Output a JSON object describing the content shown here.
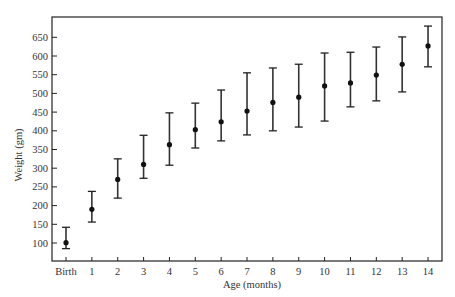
{
  "chart_data": {
    "type": "scatter",
    "subtype": "errorbar",
    "title": "",
    "xlabel": "Age (months)",
    "ylabel": "Weight (gm)",
    "categories": [
      "Birth",
      "1",
      "2",
      "3",
      "4",
      "5",
      "6",
      "7",
      "8",
      "9",
      "10",
      "11",
      "12",
      "13",
      "14"
    ],
    "series": [
      {
        "name": "Mean weight",
        "values": [
          101,
          190,
          270,
          310,
          363,
          403,
          424,
          453,
          476,
          490,
          520,
          528,
          549,
          578,
          627
        ],
        "upper": [
          142,
          238,
          325,
          388,
          448,
          474,
          509,
          555,
          568,
          578,
          608,
          610,
          624,
          651,
          680
        ],
        "lower": [
          85,
          156,
          220,
          273,
          308,
          354,
          373,
          389,
          400,
          410,
          426,
          464,
          480,
          504,
          571
        ]
      }
    ],
    "yticks": [
      100,
      150,
      200,
      250,
      300,
      350,
      400,
      450,
      500,
      550,
      600,
      650
    ],
    "ylim": [
      48,
      700
    ],
    "grid": false,
    "legend": null,
    "frame": "box"
  }
}
